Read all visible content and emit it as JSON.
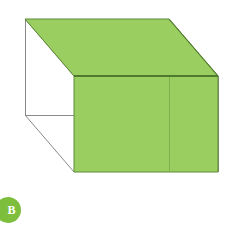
{
  "figure": {
    "background_color": "#FFFFFF",
    "label": "B",
    "badge": {
      "letter": "B",
      "fill_color": "#7DBE3C",
      "text_color": "#FFFFFF",
      "shape": "circle",
      "clipped_left": true
    }
  },
  "chart_data": {
    "type": "diagram",
    "subtype": "wireframe-cube-isometric",
    "canvas": {
      "width": 231,
      "height": 239
    },
    "colors": {
      "face_fill": "#9BCE60",
      "face_stroke": "#5E8A38",
      "wire_stroke": "#8A8A8A",
      "background": "#FFFFFF",
      "badge_fill": "#7DBE3C",
      "badge_text": "#FFFFFF"
    },
    "vertices": {
      "front_top_left": [
        74,
        76
      ],
      "front_top_right": [
        218,
        76
      ],
      "front_bottom_left": [
        74,
        172
      ],
      "front_bottom_right": [
        218,
        172
      ],
      "back_top_left": [
        25,
        19
      ],
      "back_top_right": [
        169,
        19
      ],
      "back_bottom_left": [
        25,
        115
      ],
      "back_bottom_right": [
        169,
        115
      ]
    },
    "faces": [
      {
        "name": "top-face",
        "filled": true,
        "fill": "#9BCE60",
        "points": [
          [
            74,
            76
          ],
          [
            25,
            19
          ],
          [
            169,
            19
          ],
          [
            218,
            76
          ]
        ]
      },
      {
        "name": "front-face",
        "filled": true,
        "fill": "#9BCE60",
        "points": [
          [
            74,
            76
          ],
          [
            218,
            76
          ],
          [
            218,
            172
          ],
          [
            74,
            172
          ]
        ]
      },
      {
        "name": "left-face",
        "filled": false,
        "fill": "none",
        "points": [
          [
            25,
            19
          ],
          [
            74,
            76
          ],
          [
            74,
            172
          ],
          [
            25,
            115
          ]
        ]
      },
      {
        "name": "right-face",
        "filled": false,
        "fill": "none",
        "points": [
          [
            169,
            19
          ],
          [
            218,
            76
          ],
          [
            218,
            172
          ],
          [
            169,
            115
          ]
        ]
      },
      {
        "name": "bottom-face",
        "filled": false,
        "fill": "none",
        "points": [
          [
            74,
            172
          ],
          [
            218,
            172
          ],
          [
            169,
            115
          ],
          [
            25,
            115
          ]
        ]
      },
      {
        "name": "back-face",
        "filled": false,
        "fill": "none",
        "points": [
          [
            25,
            19
          ],
          [
            169,
            19
          ],
          [
            169,
            115
          ],
          [
            25,
            115
          ]
        ]
      }
    ],
    "edges": [
      {
        "name": "top-front-edge",
        "from": [
          74,
          76
        ],
        "to": [
          218,
          76
        ],
        "style": "shaded-boundary"
      },
      {
        "name": "top-back-edge",
        "from": [
          25,
          19
        ],
        "to": [
          169,
          19
        ],
        "style": "shaded-boundary"
      },
      {
        "name": "top-left-edge",
        "from": [
          25,
          19
        ],
        "to": [
          74,
          76
        ],
        "style": "wire"
      },
      {
        "name": "top-right-edge",
        "from": [
          169,
          19
        ],
        "to": [
          218,
          76
        ],
        "style": "shaded-boundary"
      },
      {
        "name": "front-left-edge",
        "from": [
          74,
          76
        ],
        "to": [
          74,
          172
        ],
        "style": "shaded-boundary"
      },
      {
        "name": "front-right-edge",
        "from": [
          218,
          76
        ],
        "to": [
          218,
          172
        ],
        "style": "shaded-boundary"
      },
      {
        "name": "front-bottom-edge",
        "from": [
          74,
          172
        ],
        "to": [
          218,
          172
        ],
        "style": "shaded-boundary"
      },
      {
        "name": "back-left-vertical",
        "from": [
          25,
          19
        ],
        "to": [
          25,
          115
        ],
        "style": "wire"
      },
      {
        "name": "back-right-vertical",
        "from": [
          169,
          19
        ],
        "to": [
          169,
          115
        ],
        "style": "wire"
      },
      {
        "name": "bottom-back-edge",
        "from": [
          25,
          115
        ],
        "to": [
          169,
          115
        ],
        "style": "wire"
      },
      {
        "name": "bottom-left-edge",
        "from": [
          25,
          115
        ],
        "to": [
          74,
          172
        ],
        "style": "wire"
      },
      {
        "name": "bottom-right-edge",
        "from": [
          169,
          115
        ],
        "to": [
          218,
          172
        ],
        "style": "wire"
      }
    ],
    "shaded_faces": [
      "top-face",
      "front-face"
    ],
    "shaded_count": 2,
    "total_faces": 6,
    "projection": {
      "depth_dx": -49,
      "depth_dy": -57
    },
    "annotations": [
      {
        "name": "option-label",
        "text": "B",
        "position": [
          8,
          210
        ]
      }
    ]
  }
}
